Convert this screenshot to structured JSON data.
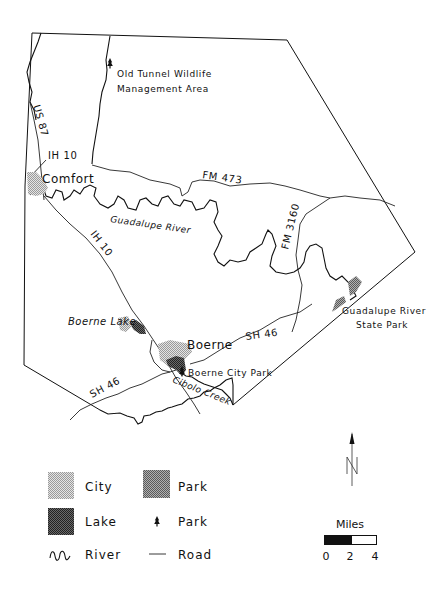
{
  "map": {
    "labels": {
      "wildlife_area_line1": "Old Tunnel Wildlife",
      "wildlife_area_line2": "Management Area",
      "us87": "US 87",
      "ih10_north": "IH 10",
      "comfort": "Comfort",
      "fm473": "FM 473",
      "guadalupe_river": "Guadalupe River",
      "ih10_south": "IH 10",
      "fm3160": "FM 3160",
      "guadalupe_state_park_line1": "Guadalupe River",
      "guadalupe_state_park_line2": "State Park",
      "boerne_lake": "Boerne Lake",
      "boerne": "Boerne",
      "sh46_east": "SH 46",
      "boerne_city_park": "Boerne City Park",
      "sh46_west": "SH 46",
      "cibolo_creek": "Cibolo Creek"
    },
    "colors": {
      "line": "#111111",
      "city_fill": "#c8c8c8",
      "park_fill": "#8a8a8a",
      "lake_fill": "#4a4a4a",
      "background": "#ffffff"
    }
  },
  "legend": {
    "items": [
      {
        "symbol": "city-pattern",
        "label": "City"
      },
      {
        "symbol": "park-pattern",
        "label": "Park"
      },
      {
        "symbol": "lake-pattern",
        "label": "Lake"
      },
      {
        "symbol": "tree-icon",
        "label": "Park"
      },
      {
        "symbol": "river-icon",
        "label": "River"
      },
      {
        "symbol": "road-line",
        "label": "Road"
      }
    ]
  },
  "north_arrow": {
    "label": "N"
  },
  "scale_bar": {
    "title": "Miles",
    "ticks": [
      "0",
      "2",
      "4"
    ]
  }
}
